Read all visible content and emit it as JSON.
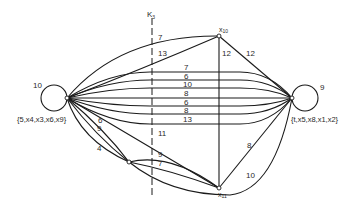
{
  "cut": {
    "label": "K",
    "subscript": "3"
  },
  "nodes": {
    "left_hub": {
      "weight": "10",
      "set": "{5,x4,x3,x6,x9}"
    },
    "right_hub": {
      "weight": "9",
      "set": "{t,x5,x8,x1,x2}"
    },
    "x10": {
      "label": "x",
      "subscript": "10"
    },
    "x11": {
      "label": "x",
      "subscript": "11"
    }
  },
  "edges": {
    "left_x10_top": "7",
    "left_x10_second": "13",
    "x10_x11_vertical": "12",
    "x10_right": "12",
    "parallel_bundle": [
      "7",
      "6",
      "10",
      "8",
      "6",
      "8",
      "13"
    ],
    "left_x11_diag": "11",
    "left_bottom_upper": "6",
    "left_bottom_mid": "9",
    "left_bottom_lower": "4",
    "bottom_x11_upper": "9",
    "bottom_x11_lower": "7",
    "x11_right": "8",
    "bottom_right_arc": "10"
  }
}
